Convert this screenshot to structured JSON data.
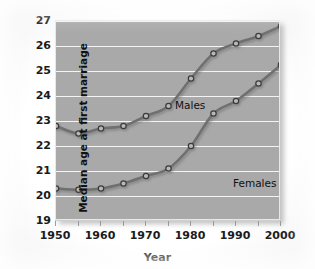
{
  "chart_data": {
    "type": "line",
    "title": "",
    "xlabel": "Year",
    "ylabel": "Median age at first marriage",
    "xlim": [
      1950,
      2000
    ],
    "ylim": [
      19,
      27
    ],
    "grid": true,
    "legend_position": "inline-annotations",
    "x": [
      1950,
      1955,
      1960,
      1965,
      1970,
      1975,
      1980,
      1985,
      1990,
      1995,
      2000
    ],
    "xticks_major": [
      1950,
      1960,
      1970,
      1980,
      1990,
      2000
    ],
    "xticks_minor": [
      1955,
      1965,
      1975,
      1985,
      1995
    ],
    "xtick_labels": [
      "1950",
      "1960",
      "1970",
      "1980",
      "1990",
      "2000"
    ],
    "yticks": [
      19,
      20,
      21,
      22,
      23,
      24,
      25,
      26,
      27
    ],
    "ytick_labels": [
      "19",
      "20",
      "21",
      "22",
      "23",
      "24",
      "25",
      "26",
      "27"
    ],
    "series": [
      {
        "name": "Males",
        "label_text": "Males",
        "color": "#6f6f6f",
        "marker": "circle",
        "values": [
          22.8,
          22.5,
          22.7,
          22.8,
          23.2,
          23.6,
          24.7,
          25.7,
          26.1,
          26.4,
          26.8
        ]
      },
      {
        "name": "Females",
        "label_text": "Females",
        "color": "#6f6f6f",
        "marker": "circle",
        "values": [
          20.3,
          20.25,
          20.3,
          20.5,
          20.8,
          21.1,
          22.0,
          23.3,
          23.8,
          24.5,
          25.25
        ]
      }
    ],
    "colors": {
      "plot_background": "#a9a9a9",
      "gridline": "#f4f4f4",
      "line": "#6f6f6f",
      "marker_fill": "#b8b8b8",
      "text": "#111111",
      "page_background": "#ffffff"
    }
  }
}
